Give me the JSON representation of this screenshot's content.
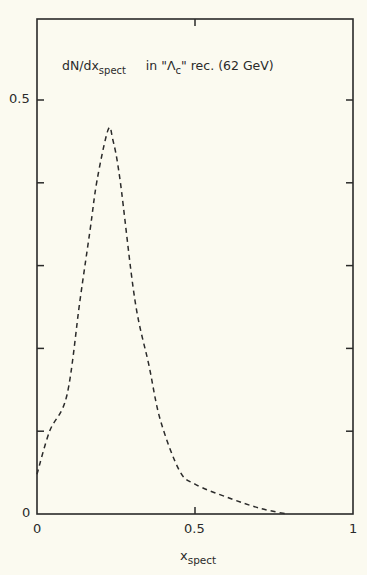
{
  "chart_data": {
    "type": "line",
    "title_parts": {
      "main": "dN/dx",
      "main_sub": "spect",
      "rest_pre": "in \"Λ",
      "rest_sub": "c",
      "rest_post": "\" rec. (62 GeV)"
    },
    "xlabel": "x_spect",
    "xlabel_parts": {
      "main": "x",
      "sub": "spect"
    },
    "ylabel": "",
    "xlim": [
      0,
      1
    ],
    "ylim": [
      0,
      0.6
    ],
    "x_ticks": [
      0,
      0.5,
      1
    ],
    "x_tick_labels": [
      "0",
      "0.5",
      "1"
    ],
    "y_ticks": [
      0,
      0.1,
      0.2,
      0.3,
      0.4,
      0.5
    ],
    "y_tick_labels": [
      "0",
      "",
      "",
      "",
      "",
      "0.5"
    ],
    "grid": false,
    "legend": null,
    "series": [
      {
        "name": "dN/dx_spect",
        "style": "dashed",
        "x": [
          0.0,
          0.04,
          0.095,
          0.136,
          0.168,
          0.19,
          0.225,
          0.24,
          0.263,
          0.31,
          0.354,
          0.39,
          0.45,
          0.5,
          0.61,
          0.705,
          0.79
        ],
        "y": [
          0.048,
          0.1,
          0.144,
          0.258,
          0.343,
          0.403,
          0.464,
          0.452,
          0.403,
          0.258,
          0.18,
          0.114,
          0.053,
          0.036,
          0.019,
          0.007,
          0.0
        ]
      }
    ]
  },
  "colors": {
    "background": "#fbfaf0",
    "ink": "#2a2a2a"
  }
}
